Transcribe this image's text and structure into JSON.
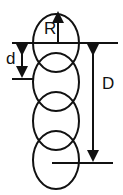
{
  "diagram": {
    "labels": {
      "radius": "R",
      "spacing": "d",
      "total": "D"
    },
    "circle_count": 4,
    "stroke_color": "#111111",
    "background": "#ffffff"
  }
}
